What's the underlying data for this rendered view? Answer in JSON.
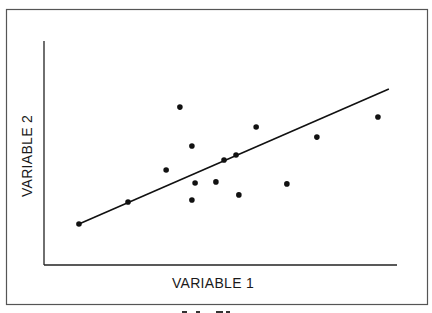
{
  "chart_data": {
    "type": "scatter",
    "title": "",
    "xlabel": "VARIABLE 1",
    "ylabel": "VARIABLE 2",
    "xlim": [
      0,
      100
    ],
    "ylim": [
      0,
      100
    ],
    "grid": false,
    "ticks": false,
    "legend": "none",
    "points": [
      {
        "x": 9.9,
        "y": 18.3
      },
      {
        "x": 23.8,
        "y": 28.1
      },
      {
        "x": 34.6,
        "y": 42.4
      },
      {
        "x": 38.5,
        "y": 70.5
      },
      {
        "x": 41.9,
        "y": 53.1
      },
      {
        "x": 41.9,
        "y": 29.0
      },
      {
        "x": 42.8,
        "y": 36.6
      },
      {
        "x": 48.7,
        "y": 37.1
      },
      {
        "x": 51.0,
        "y": 46.9
      },
      {
        "x": 54.4,
        "y": 49.1
      },
      {
        "x": 55.2,
        "y": 31.3
      },
      {
        "x": 60.1,
        "y": 61.6
      },
      {
        "x": 68.8,
        "y": 36.2
      },
      {
        "x": 77.3,
        "y": 57.1
      },
      {
        "x": 94.6,
        "y": 66.1
      }
    ],
    "trend_line": {
      "start": {
        "x": 9.9,
        "y": 18.3
      },
      "end": {
        "x": 97.7,
        "y": 78.6
      }
    },
    "colors": {
      "points": "#111111",
      "line": "#111111",
      "axes": "#222222",
      "frame": "#555555"
    }
  }
}
